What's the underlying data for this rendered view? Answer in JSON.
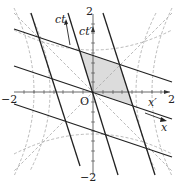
{
  "diagram": {
    "origin_label": "O",
    "axis_labels": {
      "ct": "ct",
      "ct_prime": "ct′",
      "x": "x",
      "x_prime": "x′"
    },
    "tick_labels": {
      "x_min": "−2",
      "x_max": "2",
      "y_max": "2",
      "y_min": "−2"
    },
    "colors": {
      "line": "#222222",
      "dashed": "#aaaaaa",
      "shade": "#d9d9d9"
    }
  }
}
